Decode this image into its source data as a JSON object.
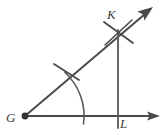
{
  "figure": {
    "width": 166,
    "height": 135,
    "background_color": "#ffffff",
    "stroke_color": "#4a4a4a",
    "label_color": "#3d3d3d"
  },
  "labels": {
    "vertex": "G",
    "upper_point": "K",
    "lower_point": "L"
  },
  "geometry": {
    "vertex_point": {
      "name": "G",
      "x": 25,
      "y": 116
    },
    "rays": [
      {
        "name": "horizontal-ray",
        "from_x": 25,
        "from_y": 116,
        "to_x": 160,
        "to_y": 116,
        "arrow": "end"
      },
      {
        "name": "slanted-ray",
        "from_x": 25,
        "from_y": 116,
        "to_x": 152,
        "to_y": 8,
        "arrow": "end"
      }
    ],
    "segments": [
      {
        "name": "vertical-segment-KL",
        "from_x": 118,
        "from_y": 30,
        "to_x": 118,
        "to_y": 128
      }
    ],
    "arcs": [
      {
        "name": "compass-arc-from-vertex",
        "center_x": 25,
        "center_y": 116,
        "radius": 59,
        "start_x": 65,
        "start_y": 73,
        "end_x": 82,
        "end_y": 124
      },
      {
        "name": "compass-arc-crossing-at-K",
        "center_x": 118,
        "center_y": 32,
        "radius": 18
      }
    ],
    "tick_marks": [
      {
        "name": "tick-on-slanted-ray",
        "x": 66,
        "y": 73,
        "angle_deg": 20,
        "length": 24
      },
      {
        "name": "tick-at-K-upper",
        "x": 118,
        "y": 32,
        "angle_deg": 20,
        "length": 26
      },
      {
        "name": "tick-at-K-lower",
        "x": 118,
        "y": 32,
        "angle_deg": -55,
        "length": 26
      }
    ]
  }
}
